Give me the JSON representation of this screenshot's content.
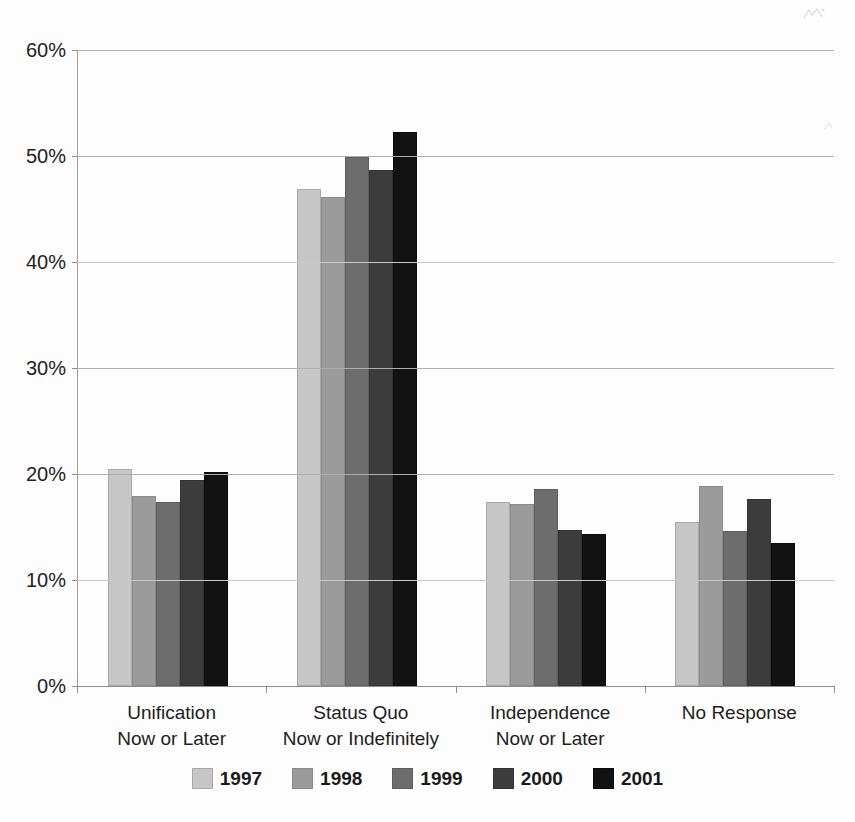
{
  "chart_data": {
    "type": "bar",
    "title": "",
    "subtitle": "",
    "xlabel": "",
    "ylabel": "",
    "grid": true,
    "legend_position": "bottom",
    "ylim": [
      0,
      60
    ],
    "ytick_labels": [
      "60%",
      "50%",
      "40%",
      "30%",
      "20%",
      "10%",
      "0%"
    ],
    "ytick_values": [
      60,
      50,
      40,
      30,
      20,
      10,
      0
    ],
    "categories": [
      "Unification Now or Later",
      "Status Quo Now or Indefinitely",
      "Independence Now or Later",
      "No Response"
    ],
    "category_lines": [
      [
        "Unification",
        "Now or Later"
      ],
      [
        "Status Quo",
        "Now or Indefinitely"
      ],
      [
        "Independence",
        "Now or Later"
      ],
      [
        "No Response",
        ""
      ]
    ],
    "series": [
      {
        "name": "1997",
        "color": "#c6c6c6",
        "values": [
          20.5,
          46.9,
          17.4,
          15.5
        ]
      },
      {
        "name": "1998",
        "color": "#9b9b9b",
        "values": [
          17.9,
          46.1,
          17.2,
          18.9
        ]
      },
      {
        "name": "1999",
        "color": "#6d6d6d",
        "values": [
          17.4,
          49.9,
          18.6,
          14.6
        ]
      },
      {
        "name": "2000",
        "color": "#3c3c3c",
        "values": [
          19.4,
          48.7,
          14.7,
          17.6
        ]
      },
      {
        "name": "2001",
        "color": "#121212",
        "values": [
          20.2,
          52.3,
          14.3,
          13.5
        ]
      }
    ]
  },
  "legend": {
    "items": [
      {
        "label": "1997"
      },
      {
        "label": "1998"
      },
      {
        "label": "1999"
      },
      {
        "label": "2000"
      },
      {
        "label": "2001"
      }
    ]
  }
}
